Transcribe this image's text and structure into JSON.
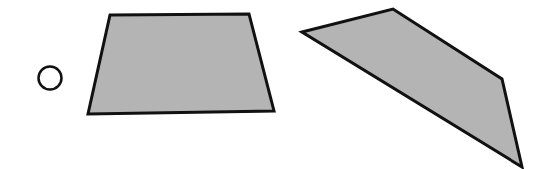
{
  "figure": {
    "width": 554,
    "height": 169,
    "background": "#ffffff",
    "stroke_color": "#111111",
    "fill_color": "#b4b4b4",
    "shapes": [
      {
        "id": "option-circle",
        "type": "circle",
        "label": "answer option marker",
        "cx": 50,
        "cy": 78,
        "r": 11.5,
        "fill": "none",
        "stroke_width": 2.5
      },
      {
        "id": "trapezoid",
        "type": "polygon",
        "label": "gray quadrilateral (trapezoid)",
        "points": [
          [
            110,
            15
          ],
          [
            249,
            14
          ],
          [
            274,
            111
          ],
          [
            88,
            114
          ]
        ],
        "stroke_width": 3
      },
      {
        "id": "irregular-quadrilateral",
        "type": "polygon",
        "label": "gray irregular quadrilateral",
        "points": [
          [
            302,
            32
          ],
          [
            393,
            9
          ],
          [
            502,
            79
          ],
          [
            522,
            167
          ]
        ],
        "stroke_width": 3
      }
    ]
  }
}
